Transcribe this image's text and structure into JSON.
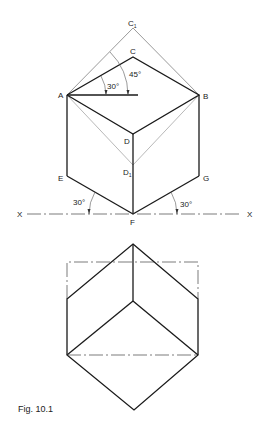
{
  "figure": {
    "caption": "Fig. 10.1",
    "top_view": {
      "points": {
        "A": "A",
        "B": "B",
        "C": "C",
        "C1": "C",
        "C1_sub": "1",
        "D": "D",
        "D1": "D",
        "D1_sub": "1",
        "E": "E",
        "F": "F",
        "G": "G"
      },
      "angles": {
        "a30_top": "30°",
        "a45": "45°",
        "a30_left": "30°",
        "a30_right": "30°"
      },
      "axis": {
        "left_label": "X",
        "right_label": "X"
      }
    },
    "bottom_view": {
      "description": "Orthographic projection of cube"
    }
  }
}
